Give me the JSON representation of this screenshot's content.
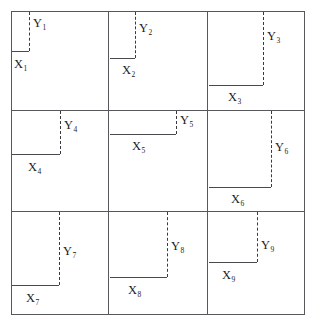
{
  "figure": {
    "title": "",
    "grid": {
      "rows": 3,
      "cols": 3,
      "frame": {
        "left": 11,
        "top": 11,
        "width": 294,
        "height": 304
      },
      "v_lines": [
        108,
        207
      ],
      "h_lines": [
        110,
        211
      ],
      "border_color": "#58585c",
      "background_color": "#ffffff"
    },
    "style": {
      "y_line_style": "dashed",
      "x_line_style": "solid",
      "y_line_color": "#3a3a3e",
      "x_line_color": "#4a4a4e"
    }
  },
  "chart_data": {
    "type": "diagram",
    "title": "",
    "xlabel": "",
    "ylabel": "",
    "categories": [
      "1",
      "2",
      "3",
      "4",
      "5",
      "6",
      "7",
      "8",
      "9"
    ],
    "series": [
      {
        "name": "X",
        "values": [
          17,
          25,
          54,
          48,
          66,
          62,
          47,
          43,
          33
        ]
      },
      {
        "name": "Y",
        "values": [
          39,
          46,
          73,
          43,
          13,
          63,
          71,
          53,
          46
        ]
      }
    ],
    "note": "Values are the pixel lengths of the X (horizontal, solid) and Y (vertical, dashed) segments in each panel"
  },
  "cells": [
    {
      "id": "cell-1",
      "panel_left": 11,
      "panel_top": 11,
      "panel_width": 97,
      "panel_height": 99,
      "x_label": "X",
      "x_sub": "1",
      "y_label": "Y",
      "y_sub": "1",
      "x_len": 17,
      "y_len": 39,
      "x_seg": {
        "left": 12,
        "top": 51,
        "width": 17
      },
      "y_seg": {
        "left": 29,
        "top": 12,
        "height": 39
      },
      "y_text": {
        "left": 33,
        "top": 17
      },
      "x_text": {
        "left": 14,
        "top": 58
      }
    },
    {
      "id": "cell-2",
      "panel_left": 108,
      "panel_top": 11,
      "panel_width": 99,
      "panel_height": 99,
      "x_label": "X",
      "x_sub": "2",
      "y_label": "Y",
      "y_sub": "2",
      "x_len": 25,
      "y_len": 46,
      "x_seg": {
        "left": 110,
        "top": 58,
        "width": 25
      },
      "y_seg": {
        "left": 135,
        "top": 12,
        "height": 46
      },
      "y_text": {
        "left": 139,
        "top": 22
      },
      "x_text": {
        "left": 122,
        "top": 64
      }
    },
    {
      "id": "cell-3",
      "panel_left": 207,
      "panel_top": 11,
      "panel_width": 98,
      "panel_height": 99,
      "x_label": "X",
      "x_sub": "3",
      "y_label": "Y",
      "y_sub": "3",
      "x_len": 54,
      "y_len": 73,
      "x_seg": {
        "left": 209,
        "top": 85,
        "width": 54
      },
      "y_seg": {
        "left": 263,
        "top": 12,
        "height": 73
      },
      "y_text": {
        "left": 267,
        "top": 30
      },
      "x_text": {
        "left": 228,
        "top": 91
      }
    },
    {
      "id": "cell-4",
      "panel_left": 11,
      "panel_top": 110,
      "panel_width": 97,
      "panel_height": 101,
      "x_label": "X",
      "x_sub": "4",
      "y_label": "Y",
      "y_sub": "4",
      "x_len": 48,
      "y_len": 43,
      "x_seg": {
        "left": 12,
        "top": 154,
        "width": 48
      },
      "y_seg": {
        "left": 60,
        "top": 111,
        "height": 43
      },
      "y_text": {
        "left": 64,
        "top": 119
      },
      "x_text": {
        "left": 28,
        "top": 161
      }
    },
    {
      "id": "cell-5",
      "panel_left": 108,
      "panel_top": 110,
      "panel_width": 99,
      "panel_height": 101,
      "x_label": "X",
      "x_sub": "5",
      "y_label": "Y",
      "y_sub": "5",
      "x_len": 66,
      "y_len": 13,
      "x_seg": {
        "left": 110,
        "top": 134,
        "width": 66
      },
      "y_seg": {
        "left": 176,
        "top": 111,
        "height": 23
      },
      "y_text": {
        "left": 180,
        "top": 114
      },
      "x_text": {
        "left": 132,
        "top": 140
      }
    },
    {
      "id": "cell-6",
      "panel_left": 207,
      "panel_top": 110,
      "panel_width": 98,
      "panel_height": 101,
      "x_label": "X",
      "x_sub": "6",
      "y_label": "Y",
      "y_sub": "6",
      "x_len": 62,
      "y_len": 63,
      "x_seg": {
        "left": 209,
        "top": 187,
        "width": 62
      },
      "y_seg": {
        "left": 271,
        "top": 111,
        "height": 76
      },
      "y_text": {
        "left": 275,
        "top": 141
      },
      "x_text": {
        "left": 231,
        "top": 193
      }
    },
    {
      "id": "cell-7",
      "panel_left": 11,
      "panel_top": 211,
      "panel_width": 97,
      "panel_height": 104,
      "x_label": "X",
      "x_sub": "7",
      "y_label": "Y",
      "y_sub": "7",
      "x_len": 47,
      "y_len": 71,
      "x_seg": {
        "left": 12,
        "top": 285,
        "width": 47
      },
      "y_seg": {
        "left": 59,
        "top": 212,
        "height": 73
      },
      "y_text": {
        "left": 63,
        "top": 245
      },
      "x_text": {
        "left": 26,
        "top": 292
      }
    },
    {
      "id": "cell-8",
      "panel_left": 108,
      "panel_top": 211,
      "panel_width": 99,
      "panel_height": 104,
      "x_label": "X",
      "x_sub": "8",
      "y_label": "Y",
      "y_sub": "8",
      "x_len": 43,
      "y_len": 53,
      "x_seg": {
        "left": 110,
        "top": 277,
        "width": 57
      },
      "y_seg": {
        "left": 167,
        "top": 212,
        "height": 65
      },
      "y_text": {
        "left": 171,
        "top": 240
      },
      "x_text": {
        "left": 128,
        "top": 284
      }
    },
    {
      "id": "cell-9",
      "panel_left": 207,
      "panel_top": 211,
      "panel_width": 98,
      "panel_height": 104,
      "x_label": "X",
      "x_sub": "9",
      "y_label": "Y",
      "y_sub": "9",
      "x_len": 33,
      "y_len": 46,
      "x_seg": {
        "left": 209,
        "top": 262,
        "width": 48
      },
      "y_seg": {
        "left": 257,
        "top": 212,
        "height": 50
      },
      "y_text": {
        "left": 261,
        "top": 239
      },
      "x_text": {
        "left": 222,
        "top": 269
      }
    }
  ]
}
